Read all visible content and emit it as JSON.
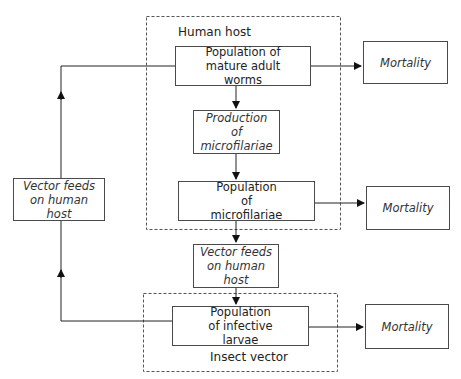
{
  "regions": {
    "human_host": "Human host",
    "insect_vector": "Insect vector"
  },
  "boxes": {
    "adult_worms": "Population of mature adult worms",
    "production": "Production of microfilariae",
    "microfilariae": "Population of microfilariae",
    "vector_feeds_mid": "Vector feeds on human host",
    "infective_larvae": "Population of infective larvae",
    "vector_feeds_left": "Vector feeds on human host",
    "mortality_1": "Mortality",
    "mortality_2": "Mortality",
    "mortality_3": "Mortality"
  }
}
